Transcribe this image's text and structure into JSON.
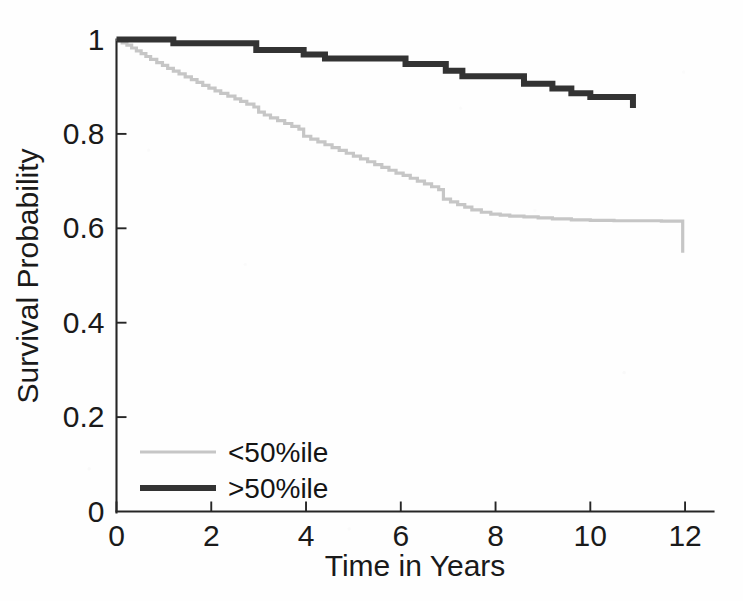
{
  "figure": {
    "background_color": "#fefefe",
    "foreground_color": "#1a1a1a"
  },
  "axes": {
    "x_title": "Time in Years",
    "y_title": "Survival Probability",
    "x_ticks": [
      "0",
      "2",
      "4",
      "6",
      "8",
      "10",
      "12"
    ],
    "y_ticks": [
      "0",
      "0.2",
      "0.4",
      "0.6",
      "0.8",
      "1"
    ]
  },
  "legend": {
    "entries": [
      {
        "label": "<50%ile",
        "color": "#c6c6c6",
        "width": 3.2
      },
      {
        "label": ">50%ile",
        "color": "#333333",
        "width": 6.0
      }
    ]
  },
  "chart_data": {
    "type": "line",
    "title": "",
    "subtitle": "",
    "xlabel": "Time in Years",
    "ylabel": "Survival Probability",
    "xlim": [
      0,
      12.6
    ],
    "ylim": [
      0,
      1
    ],
    "x_ticks": [
      0,
      2,
      4,
      6,
      8,
      10,
      12
    ],
    "y_ticks": [
      0,
      0.2,
      0.4,
      0.6,
      0.8,
      1
    ],
    "grid": false,
    "legend_position": "lower-left-inside",
    "step_style": "post",
    "annotations": [],
    "series": [
      {
        "name": "<50%ile",
        "color": "#c6c6c6",
        "line_width": 3.2,
        "points": [
          [
            0.0,
            1.0
          ],
          [
            0.12,
            0.993
          ],
          [
            0.22,
            0.988
          ],
          [
            0.32,
            0.982
          ],
          [
            0.42,
            0.976
          ],
          [
            0.52,
            0.97
          ],
          [
            0.62,
            0.964
          ],
          [
            0.72,
            0.958
          ],
          [
            0.85,
            0.951
          ],
          [
            0.97,
            0.945
          ],
          [
            1.08,
            0.939
          ],
          [
            1.2,
            0.933
          ],
          [
            1.32,
            0.927
          ],
          [
            1.45,
            0.921
          ],
          [
            1.58,
            0.915
          ],
          [
            1.7,
            0.909
          ],
          [
            1.82,
            0.903
          ],
          [
            1.95,
            0.897
          ],
          [
            2.08,
            0.891
          ],
          [
            2.2,
            0.886
          ],
          [
            2.35,
            0.88
          ],
          [
            2.5,
            0.874
          ],
          [
            2.62,
            0.869
          ],
          [
            2.75,
            0.863
          ],
          [
            2.9,
            0.857
          ],
          [
            3.0,
            0.846
          ],
          [
            3.12,
            0.84
          ],
          [
            3.25,
            0.834
          ],
          [
            3.4,
            0.828
          ],
          [
            3.55,
            0.822
          ],
          [
            3.7,
            0.816
          ],
          [
            3.85,
            0.81
          ],
          [
            3.95,
            0.795
          ],
          [
            4.1,
            0.789
          ],
          [
            4.25,
            0.783
          ],
          [
            4.4,
            0.777
          ],
          [
            4.55,
            0.771
          ],
          [
            4.7,
            0.765
          ],
          [
            4.85,
            0.759
          ],
          [
            5.0,
            0.753
          ],
          [
            5.15,
            0.747
          ],
          [
            5.3,
            0.741
          ],
          [
            5.45,
            0.735
          ],
          [
            5.6,
            0.729
          ],
          [
            5.75,
            0.723
          ],
          [
            5.9,
            0.717
          ],
          [
            6.05,
            0.712
          ],
          [
            6.2,
            0.706
          ],
          [
            6.35,
            0.7
          ],
          [
            6.5,
            0.694
          ],
          [
            6.65,
            0.688
          ],
          [
            6.8,
            0.682
          ],
          [
            6.9,
            0.662
          ],
          [
            7.05,
            0.656
          ],
          [
            7.2,
            0.65
          ],
          [
            7.35,
            0.645
          ],
          [
            7.5,
            0.639
          ],
          [
            7.7,
            0.634
          ],
          [
            7.9,
            0.63
          ],
          [
            8.1,
            0.628
          ],
          [
            8.3,
            0.626
          ],
          [
            8.6,
            0.624
          ],
          [
            8.9,
            0.622
          ],
          [
            9.2,
            0.62
          ],
          [
            9.6,
            0.618
          ],
          [
            10.0,
            0.617
          ],
          [
            10.5,
            0.616
          ],
          [
            11.0,
            0.616
          ],
          [
            11.5,
            0.615
          ],
          [
            11.9,
            0.615
          ],
          [
            11.95,
            0.548
          ]
        ]
      },
      {
        "name": ">50%ile",
        "color": "#333333",
        "line_width": 6.0,
        "points": [
          [
            0.0,
            1.0
          ],
          [
            1.15,
            1.0
          ],
          [
            1.2,
            0.992
          ],
          [
            2.85,
            0.992
          ],
          [
            2.95,
            0.978
          ],
          [
            3.85,
            0.978
          ],
          [
            3.95,
            0.968
          ],
          [
            4.3,
            0.968
          ],
          [
            4.4,
            0.96
          ],
          [
            6.0,
            0.96
          ],
          [
            6.1,
            0.948
          ],
          [
            6.85,
            0.948
          ],
          [
            6.95,
            0.934
          ],
          [
            7.2,
            0.934
          ],
          [
            7.3,
            0.922
          ],
          [
            8.5,
            0.922
          ],
          [
            8.6,
            0.906
          ],
          [
            9.1,
            0.906
          ],
          [
            9.2,
            0.896
          ],
          [
            9.5,
            0.896
          ],
          [
            9.6,
            0.886
          ],
          [
            9.9,
            0.886
          ],
          [
            10.0,
            0.878
          ],
          [
            10.85,
            0.878
          ],
          [
            10.9,
            0.855
          ]
        ]
      }
    ]
  }
}
